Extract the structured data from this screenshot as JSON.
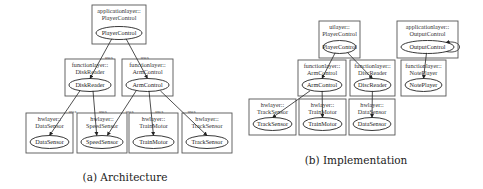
{
  "figures": [
    {
      "id": "architecture",
      "caption": "(a) Architecture",
      "caption_pos": {
        "x": 125,
        "y": 171
      },
      "clusters": [
        {
          "id": "a_player",
          "line1": "applicationlayer::",
          "line2": "PlayerControl",
          "node": "PlayerControl",
          "x": 92,
          "y": 5,
          "w": 54,
          "h": 39
        },
        {
          "id": "a_disk",
          "line1": "functionlayer::",
          "line2": "DiskReader",
          "node": "DiskReader",
          "x": 65,
          "y": 59,
          "w": 50,
          "h": 37
        },
        {
          "id": "a_arm",
          "line1": "functionlayer::",
          "line2": "ArmControl",
          "node": "ArmControl",
          "x": 122,
          "y": 59,
          "w": 51,
          "h": 37
        },
        {
          "id": "a_data",
          "line1": "hwlayer::",
          "line2": "DataSensor",
          "node": "DataSensor",
          "x": 26,
          "y": 113,
          "w": 47,
          "h": 40
        },
        {
          "id": "a_speed",
          "line1": "hwlayer::",
          "line2": "SpeedSensor",
          "node": "SpeedSensor",
          "x": 77,
          "y": 113,
          "w": 50,
          "h": 40
        },
        {
          "id": "a_train",
          "line1": "hwlayer::",
          "line2": "TrainMotor",
          "node": "TrainMotor",
          "x": 129,
          "y": 113,
          "w": 49,
          "h": 40
        },
        {
          "id": "a_track",
          "line1": "hwlayer::",
          "line2": "TrackSensor",
          "node": "TrackSensor",
          "x": 182,
          "y": 113,
          "w": 50,
          "h": 40
        }
      ],
      "edges": [
        {
          "from": "a_player",
          "to": "a_disk",
          "label": "uses"
        },
        {
          "from": "a_player",
          "to": "a_arm",
          "label": "uses"
        },
        {
          "from": "a_disk",
          "to": "a_data",
          "label": "uses"
        },
        {
          "from": "a_disk",
          "to": "a_speed",
          "label": "uses"
        },
        {
          "from": "a_arm",
          "to": "a_speed",
          "label": "uses"
        },
        {
          "from": "a_arm",
          "to": "a_train",
          "label": "uses"
        },
        {
          "from": "a_arm",
          "to": "a_track",
          "label": "uses"
        }
      ]
    },
    {
      "id": "implementation",
      "caption": "(b) Implementation",
      "caption_pos": {
        "x": 356,
        "y": 154
      },
      "clusters": [
        {
          "id": "b_player",
          "line1": "uilayer::",
          "line2": "PlayerControl",
          "node": "PlayerControl",
          "x": 319,
          "y": 21,
          "w": 41,
          "h": 37
        },
        {
          "id": "b_output",
          "line1": "applicationlayer::",
          "line2": "OutputControl",
          "node": "OutputControl",
          "x": 397,
          "y": 21,
          "w": 61,
          "h": 37
        },
        {
          "id": "b_arm",
          "line1": "functionlayer::",
          "line2": "ArmControl",
          "node": "ArmControl",
          "x": 298,
          "y": 60,
          "w": 48,
          "h": 36
        },
        {
          "id": "b_disc",
          "line1": "functionlayer::",
          "line2": "DiscReader",
          "node": "DiscReader",
          "x": 350,
          "y": 60,
          "w": 45,
          "h": 36
        },
        {
          "id": "b_note",
          "line1": "functionlayer::",
          "line2": "NotePlayer",
          "node": "NotePlayer",
          "x": 401,
          "y": 60,
          "w": 45,
          "h": 36
        },
        {
          "id": "b_track",
          "line1": "hwlayer::",
          "line2": "TrackSensor",
          "node": "TrackSensor",
          "x": 249,
          "y": 99,
          "w": 47,
          "h": 36
        },
        {
          "id": "b_train",
          "line1": "hwlayer::",
          "line2": "TrainMotor",
          "node": "TrainMotor",
          "x": 299,
          "y": 99,
          "w": 47,
          "h": 36
        },
        {
          "id": "b_datas",
          "line1": "hwlayer::",
          "line2": "DataSensor",
          "node": "DataSensor",
          "x": 349,
          "y": 99,
          "w": 46,
          "h": 36
        }
      ],
      "edges": [
        {
          "from": "b_player",
          "to": "b_arm",
          "label": ""
        },
        {
          "from": "b_player",
          "to": "b_disc",
          "label": ""
        },
        {
          "from": "b_output",
          "to": "b_note",
          "label": ""
        },
        {
          "from": "b_output",
          "to": "b_output",
          "label": "",
          "self_loop": true
        },
        {
          "from": "b_arm",
          "to": "b_track",
          "label": ""
        },
        {
          "from": "b_arm",
          "to": "b_train",
          "label": ""
        },
        {
          "from": "b_disc",
          "to": "b_datas",
          "label": ""
        }
      ]
    }
  ],
  "colors": {
    "cluster_stroke": "#555555",
    "node_stroke": "#222222",
    "edge": "#222222",
    "background": "#ffffff"
  }
}
